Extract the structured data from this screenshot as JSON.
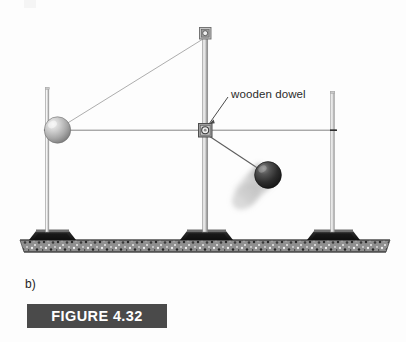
{
  "figure": {
    "part_label": "b)",
    "caption": "FIGURE 4.32",
    "banner_color": "#4a4a4a",
    "banner_text_color": "#ffffff"
  },
  "annotations": {
    "dowel_label": "wooden dowel"
  },
  "icons": {
    "pivot": "pivot-clamp-icon",
    "top_clamp": "top-clamp-icon"
  },
  "scene": {
    "ground_label": "speckled-granite-surface",
    "stands": [
      {
        "name": "left-stand-base"
      },
      {
        "name": "center-stand-base"
      },
      {
        "name": "right-stand-base"
      }
    ],
    "poles": [
      {
        "name": "left-pole"
      },
      {
        "name": "center-pole"
      },
      {
        "name": "right-pole"
      }
    ],
    "balls": [
      {
        "name": "light-ball",
        "shade": "#b9b9b9"
      },
      {
        "name": "dark-ball",
        "shade": "#2e2e2e"
      }
    ],
    "lines": [
      {
        "name": "horizontal-string"
      },
      {
        "name": "upper-support-string"
      },
      {
        "name": "lower-swing-string"
      },
      {
        "name": "dowel-pointer-line"
      }
    ]
  },
  "colors": {
    "page_background": "#fdfdfd",
    "rod_light": "#e2e2e2",
    "rod_edge": "#8d8d8d",
    "string": "#6f6f6f",
    "ground_dark": "#3a3a3a",
    "text": "#2b2b2b"
  }
}
